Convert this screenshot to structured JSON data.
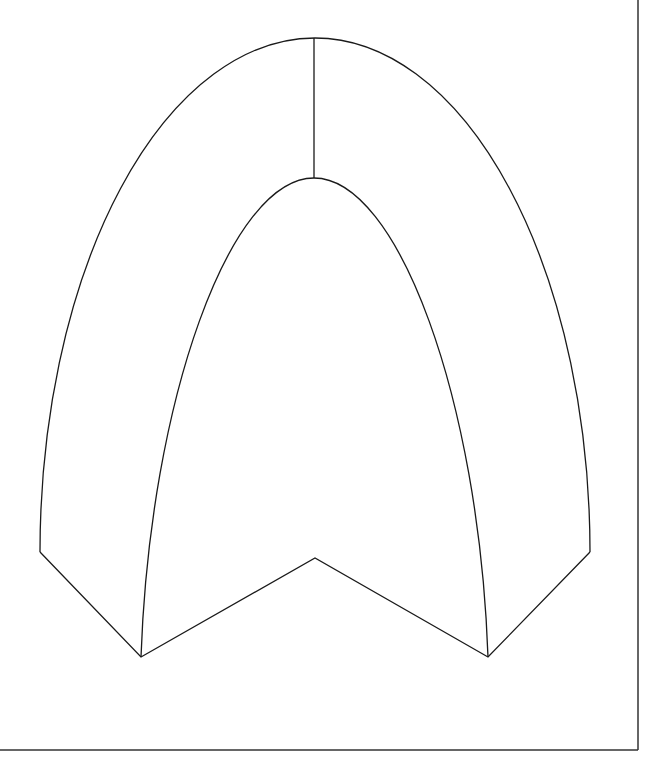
{
  "diagram": {
    "colors": {
      "stroke": "#1a1a1a",
      "frame": "#333333",
      "background": "#ffffff"
    },
    "frame": {
      "right_x": 638,
      "bottom_y": 750
    },
    "outer_arc": {
      "start": [
        40,
        552
      ],
      "end": [
        590,
        552
      ],
      "rx": 275,
      "ry": 514
    },
    "inner_arc": {
      "left_base": [
        141,
        657
      ],
      "apex": [
        314,
        178
      ],
      "right_base": [
        488,
        657
      ]
    },
    "apex_seam": {
      "top": [
        314,
        38
      ],
      "bottom": [
        314,
        178
      ]
    },
    "base_polyline": [
      [
        40,
        552
      ],
      [
        141,
        657
      ],
      [
        315,
        558
      ],
      [
        488,
        657
      ],
      [
        590,
        552
      ]
    ]
  }
}
